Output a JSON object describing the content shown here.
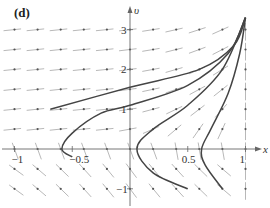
{
  "panel_label": "(d)",
  "chart_data": {
    "type": "line",
    "subtype": "direction-field-with-trajectories",
    "title": "(d)",
    "xlabel": "x",
    "ylabel": "υ",
    "xlim": [
      -1.1,
      1.15
    ],
    "ylim": [
      -1.3,
      3.7
    ],
    "x_ticks": [
      -1,
      -0.5,
      0.5,
      1
    ],
    "x_tick_labels": [
      "−1",
      "−0.5",
      "0.5",
      "1"
    ],
    "y_ticks": [
      -1,
      1,
      2,
      3
    ],
    "y_tick_labels": [
      "−1",
      "1",
      "2",
      "3"
    ],
    "grid": false,
    "legend": null,
    "direction_field": {
      "x_positions": [
        -1,
        -0.8,
        -0.6,
        -0.4,
        -0.2,
        0,
        0.2,
        0.4,
        0.6,
        0.8,
        1
      ],
      "y_positions": [
        -1,
        -0.5,
        0,
        0.5,
        1,
        1.5,
        2,
        2.5,
        3
      ],
      "description": "arrows nearly horizontal pointing right at large υ; tilting upward near x≈1; pointing up-left below the x-axis"
    },
    "series": [
      {
        "name": "trajectory-1",
        "points": [
          [
            -0.69,
            1.0
          ],
          [
            0,
            1.55
          ],
          [
            0.6,
            2.0
          ],
          [
            0.9,
            2.6
          ],
          [
            1.0,
            3.3
          ]
        ]
      },
      {
        "name": "trajectory-2",
        "points": [
          [
            -0.5,
            -0.2
          ],
          [
            -0.59,
            0
          ],
          [
            -0.5,
            0.4
          ],
          [
            -0.25,
            0.9
          ],
          [
            0,
            1.1
          ],
          [
            0.5,
            1.6
          ],
          [
            0.85,
            2.4
          ],
          [
            1.0,
            3.3
          ]
        ]
      },
      {
        "name": "trajectory-3",
        "points": [
          [
            0.5,
            -1.0
          ],
          [
            0.2,
            -0.6
          ],
          [
            0.06,
            0
          ],
          [
            0.2,
            0.5
          ],
          [
            0.5,
            1.1
          ],
          [
            0.8,
            2.0
          ],
          [
            1.0,
            3.3
          ]
        ]
      },
      {
        "name": "trajectory-4",
        "points": [
          [
            0.8,
            -1.0
          ],
          [
            0.65,
            -0.4
          ],
          [
            0.62,
            0
          ],
          [
            0.7,
            0.5
          ],
          [
            0.85,
            1.4
          ],
          [
            0.95,
            2.4
          ],
          [
            1.0,
            3.3
          ]
        ]
      }
    ]
  }
}
